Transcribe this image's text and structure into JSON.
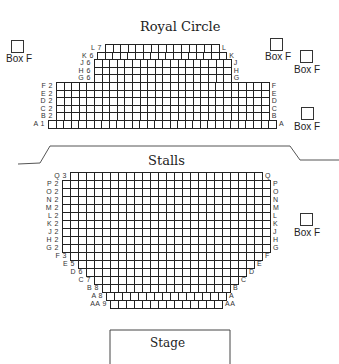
{
  "sections": {
    "royal_circle": {
      "title": "Royal Circle",
      "rows": [
        {
          "row": "L",
          "first": "7",
          "seats": 15,
          "right": "L"
        },
        {
          "row": "K",
          "first": "6",
          "seats": 17,
          "right": "K"
        },
        {
          "row": "J",
          "first": "6",
          "seats": 18,
          "right": "J"
        },
        {
          "row": "H",
          "first": "6",
          "seats": 18,
          "right": "H"
        },
        {
          "row": "G",
          "first": "6",
          "seats": 18,
          "right": "G"
        },
        {
          "row": "F",
          "first": "2",
          "seats": 28,
          "right": "F"
        },
        {
          "row": "E",
          "first": "2",
          "seats": 28,
          "right": "E"
        },
        {
          "row": "D",
          "first": "2",
          "seats": 28,
          "right": "D"
        },
        {
          "row": "C",
          "first": "2",
          "seats": 28,
          "right": "C"
        },
        {
          "row": "B",
          "first": "2",
          "seats": 28,
          "right": "B"
        },
        {
          "row": "A",
          "first": "1",
          "seats": 30,
          "right": "A"
        }
      ]
    },
    "stalls": {
      "title": "Stalls",
      "rows": [
        {
          "row": "Q",
          "first": "3",
          "seats": 24,
          "right": "Q"
        },
        {
          "row": "P",
          "first": "2",
          "seats": 26,
          "right": "P"
        },
        {
          "row": "O",
          "first": "2",
          "seats": 26,
          "right": "O"
        },
        {
          "row": "N",
          "first": "2",
          "seats": 26,
          "right": "N"
        },
        {
          "row": "M",
          "first": "2",
          "seats": 26,
          "right": "M"
        },
        {
          "row": "L",
          "first": "2",
          "seats": 26,
          "right": "L"
        },
        {
          "row": "K",
          "first": "2",
          "seats": 26,
          "right": "K"
        },
        {
          "row": "J",
          "first": "2",
          "seats": 26,
          "right": "J"
        },
        {
          "row": "H",
          "first": "2",
          "seats": 26,
          "right": "H"
        },
        {
          "row": "G",
          "first": "2",
          "seats": 26,
          "right": "G"
        },
        {
          "row": "F",
          "first": "3",
          "seats": 24,
          "right": "F"
        },
        {
          "row": "E",
          "first": "5",
          "seats": 22,
          "right": "E"
        },
        {
          "row": "D",
          "first": "6",
          "seats": 20,
          "right": "D"
        },
        {
          "row": "C",
          "first": "7",
          "seats": 18,
          "right": "C"
        },
        {
          "row": "B",
          "first": "8",
          "seats": 16,
          "right": "B"
        },
        {
          "row": "A",
          "first": "8",
          "seats": 15,
          "right": "A"
        },
        {
          "row": "AA",
          "first": "9",
          "seats": 14,
          "right": "AA"
        }
      ]
    }
  },
  "boxes": [
    {
      "id": "box-rc-left",
      "label": "Box F"
    },
    {
      "id": "box-rc-right-1",
      "label": "Box F"
    },
    {
      "id": "box-rc-right-2",
      "label": "Box F"
    },
    {
      "id": "box-rc-right-3",
      "label": "Box F"
    },
    {
      "id": "box-stalls-right",
      "label": "Box F"
    }
  ],
  "stage": {
    "label": "Stage"
  }
}
